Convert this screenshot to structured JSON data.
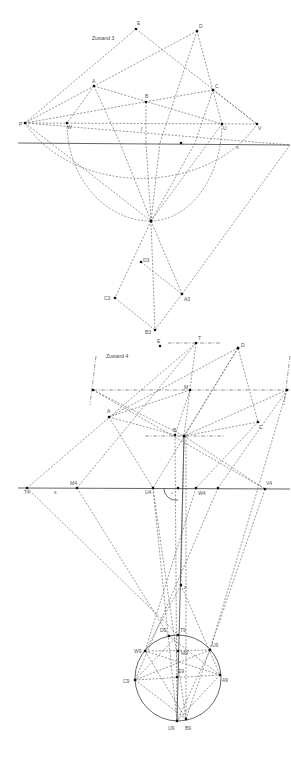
{
  "diagram_1": {
    "title": "Zustand 3",
    "points": [
      {
        "name": "E",
        "x": 136,
        "y": 29
      },
      {
        "name": "D",
        "x": 197,
        "y": 31
      },
      {
        "name": "A",
        "x": 94,
        "y": 86
      },
      {
        "name": "B",
        "x": 146,
        "y": 102
      },
      {
        "name": "C",
        "x": 213,
        "y": 90
      },
      {
        "name": "P",
        "x": 25,
        "y": 123
      },
      {
        "name": "W",
        "x": 67,
        "y": 123
      },
      {
        "name": "U",
        "x": 222,
        "y": 124
      },
      {
        "name": "V",
        "x": 257,
        "y": 124
      },
      {
        "name": "S",
        "x": 181,
        "y": 143
      },
      {
        "name": "F",
        "x": 151,
        "y": 221
      },
      {
        "name": "D3",
        "x": 141,
        "y": 262
      },
      {
        "name": "C3",
        "x": 115,
        "y": 298
      },
      {
        "name": "A3",
        "x": 182,
        "y": 294
      },
      {
        "name": "B3",
        "x": 155,
        "y": 330
      }
    ],
    "labels": [
      {
        "text": "E",
        "x": 137,
        "y": 25
      },
      {
        "text": "D",
        "x": 199,
        "y": 28
      },
      {
        "text": "A",
        "x": 93,
        "y": 83
      },
      {
        "text": "B",
        "x": 145,
        "y": 98
      },
      {
        "text": "C",
        "x": 215,
        "y": 88
      },
      {
        "text": "P",
        "x": 19,
        "y": 126
      },
      {
        "text": "W",
        "x": 67,
        "y": 129
      },
      {
        "text": "f",
        "x": 141,
        "y": 131
      },
      {
        "text": "U",
        "x": 223,
        "y": 130
      },
      {
        "text": "V",
        "x": 258,
        "y": 130
      },
      {
        "text": "s",
        "x": 236,
        "y": 149
      },
      {
        "text": "C3",
        "x": 105,
        "y": 299
      },
      {
        "text": "D3",
        "x": 143,
        "y": 262
      },
      {
        "text": "A3",
        "x": 184,
        "y": 301
      },
      {
        "text": "B3",
        "x": 146,
        "y": 333
      }
    ],
    "trace_line_label": "s"
  },
  "diagram_2": {
    "title": "Zustand 4",
    "points": [
      {
        "name": "E",
        "x": 160,
        "y": 346
      },
      {
        "name": "T",
        "x": 196,
        "y": 343
      },
      {
        "name": "D",
        "x": 238,
        "y": 348
      },
      {
        "name": "V",
        "x": 93,
        "y": 390
      },
      {
        "name": "M",
        "x": 190,
        "y": 390
      },
      {
        "name": "Vright",
        "x": 287,
        "y": 390
      },
      {
        "name": "A",
        "x": 109,
        "y": 417
      },
      {
        "name": "C",
        "x": 258,
        "y": 422
      },
      {
        "name": "B",
        "x": 175,
        "y": 435
      },
      {
        "name": "M2",
        "x": 184,
        "y": 436
      },
      {
        "name": "T4",
        "x": 27,
        "y": 488
      },
      {
        "name": "M4",
        "x": 77,
        "y": 488
      },
      {
        "name": "U4",
        "x": 153,
        "y": 488
      },
      {
        "name": "X",
        "x": 178,
        "y": 488
      },
      {
        "name": "W4",
        "x": 196,
        "y": 488
      },
      {
        "name": "Y",
        "x": 218,
        "y": 488
      },
      {
        "name": "V4",
        "x": 265,
        "y": 489
      },
      {
        "name": "Z",
        "x": 181,
        "y": 585
      },
      {
        "name": "D9",
        "x": 169,
        "y": 636
      },
      {
        "name": "T9",
        "x": 178,
        "y": 635
      },
      {
        "name": "W9",
        "x": 145,
        "y": 651
      },
      {
        "name": "M9",
        "x": 178,
        "y": 651
      },
      {
        "name": "U9",
        "x": 210,
        "y": 650
      },
      {
        "name": "A9",
        "x": 220,
        "y": 675
      },
      {
        "name": "E9",
        "x": 177,
        "y": 677
      },
      {
        "name": "C9",
        "x": 135,
        "y": 680
      },
      {
        "name": "U9b",
        "x": 177,
        "y": 721
      },
      {
        "name": "B9",
        "x": 186,
        "y": 719
      }
    ],
    "labels": [
      {
        "text": "E",
        "x": 157,
        "y": 343
      },
      {
        "text": "T",
        "x": 198,
        "y": 340
      },
      {
        "text": "D",
        "x": 241,
        "y": 347
      },
      {
        "text": "M",
        "x": 184,
        "y": 389
      },
      {
        "text": "A",
        "x": 107,
        "y": 413
      },
      {
        "text": "B",
        "x": 173,
        "y": 432
      },
      {
        "text": "C",
        "x": 259,
        "y": 429
      },
      {
        "text": "M4",
        "x": 70,
        "y": 485
      },
      {
        "text": "T4",
        "x": 24,
        "y": 494
      },
      {
        "text": "s",
        "x": 54,
        "y": 494
      },
      {
        "text": "U4",
        "x": 145,
        "y": 494
      },
      {
        "text": "W4",
        "x": 198,
        "y": 495
      },
      {
        "text": "V4",
        "x": 266,
        "y": 485
      },
      {
        "text": "z",
        "x": 184,
        "y": 589
      },
      {
        "text": "D9",
        "x": 160,
        "y": 632
      },
      {
        "text": "T9",
        "x": 180,
        "y": 632
      },
      {
        "text": "W9",
        "x": 135,
        "y": 652
      },
      {
        "text": "M9",
        "x": 181,
        "y": 654
      },
      {
        "text": "U9",
        "x": 212,
        "y": 647
      },
      {
        "text": "E9",
        "x": 178,
        "y": 673
      },
      {
        "text": "C9",
        "x": 124,
        "y": 683
      },
      {
        "text": "A9",
        "x": 222,
        "y": 682
      },
      {
        "text": "U9",
        "x": 169,
        "y": 730
      },
      {
        "text": "B9",
        "x": 185,
        "y": 730
      }
    ],
    "trace_line_label": "s",
    "right_angle_marker": "·"
  }
}
